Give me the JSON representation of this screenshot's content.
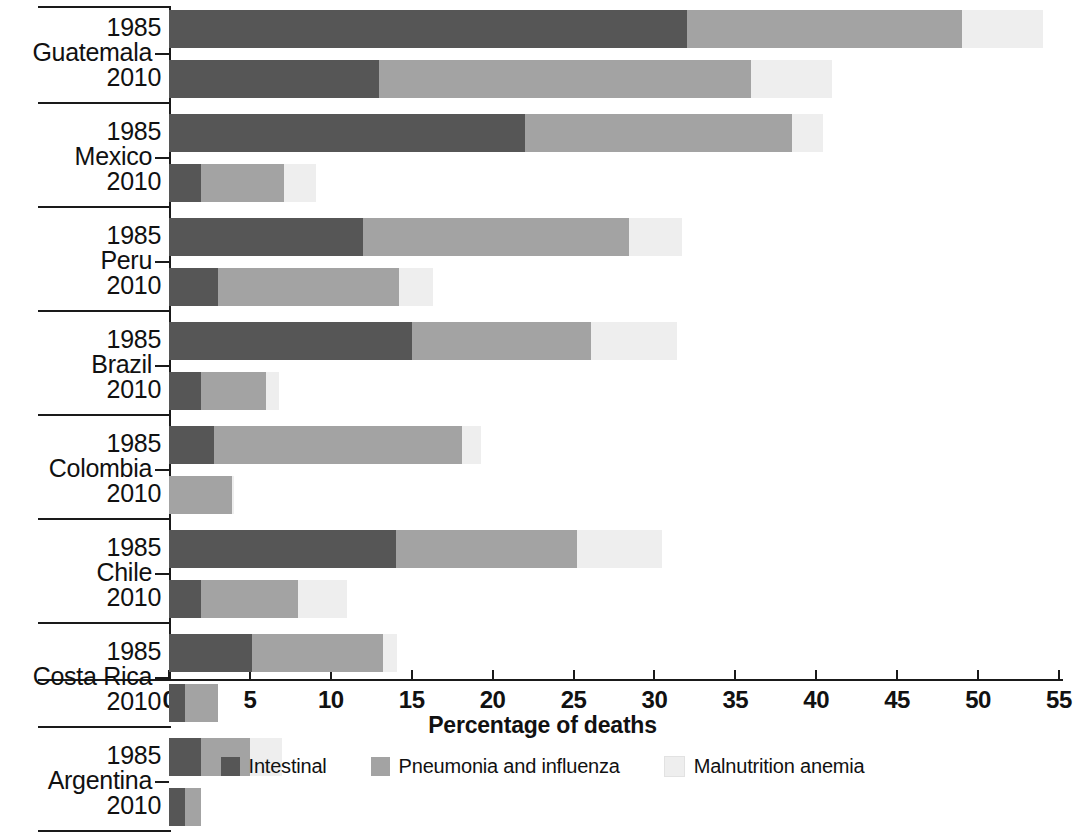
{
  "chart_data": {
    "type": "bar",
    "title": "",
    "subtype": "stacked-horizontal-bar-grouped",
    "xlabel": "Percentage of deaths",
    "ylabel": "",
    "xlim": [
      0,
      55
    ],
    "xticks": [
      0,
      5,
      10,
      15,
      20,
      25,
      30,
      35,
      40,
      45,
      50,
      55
    ],
    "grid": false,
    "legend_position": "bottom",
    "series": [
      {
        "name": "Intestinal",
        "color": "#565656"
      },
      {
        "name": "Pneumonia and influenza",
        "color": "#a3a3a3"
      },
      {
        "name": "Malnutrition anemia",
        "color": "#eeeeee"
      }
    ],
    "groups": [
      {
        "country": "Guatemala",
        "rows": [
          {
            "year": "1985",
            "values": [
              32.0,
              17.0,
              5.0
            ],
            "total": 54.0
          },
          {
            "year": "2010",
            "values": [
              13.0,
              23.0,
              5.0
            ],
            "total": 41.0
          }
        ]
      },
      {
        "country": "Mexico",
        "rows": [
          {
            "year": "1985",
            "values": [
              22.0,
              16.5,
              1.9
            ],
            "total": 40.4
          },
          {
            "year": "2010",
            "values": [
              2.0,
              5.1,
              2.0
            ],
            "total": 9.1
          }
        ]
      },
      {
        "country": "Peru",
        "rows": [
          {
            "year": "1985",
            "values": [
              12.0,
              16.4,
              3.3
            ],
            "total": 31.7
          },
          {
            "year": "2010",
            "values": [
              3.0,
              11.2,
              2.1
            ],
            "total": 16.3
          }
        ]
      },
      {
        "country": "Brazil",
        "rows": [
          {
            "year": "1985",
            "values": [
              15.0,
              11.1,
              5.3
            ],
            "total": 31.4
          },
          {
            "year": "2010",
            "values": [
              2.0,
              4.0,
              0.8
            ],
            "total": 6.8
          }
        ]
      },
      {
        "country": "Colombia",
        "rows": [
          {
            "year": "1985",
            "values": [
              2.8,
              15.3,
              1.2
            ],
            "total": 19.3
          },
          {
            "year": "2010",
            "values": [
              0.0,
              3.9,
              0.1
            ],
            "total": 4.0
          }
        ]
      },
      {
        "country": "Chile",
        "rows": [
          {
            "year": "1985",
            "values": [
              14.0,
              11.2,
              5.3
            ],
            "total": 30.5
          },
          {
            "year": "2010",
            "values": [
              2.0,
              6.0,
              3.0
            ],
            "total": 11.0
          }
        ]
      },
      {
        "country": "Costa Rica",
        "rows": [
          {
            "year": "1985",
            "values": [
              5.1,
              8.1,
              0.9
            ],
            "total": 14.1
          },
          {
            "year": "2010",
            "values": [
              1.0,
              2.0,
              0.0
            ],
            "total": 3.0
          }
        ]
      },
      {
        "country": "Argentina",
        "rows": [
          {
            "year": "1985",
            "values": [
              2.0,
              3.0,
              2.0
            ],
            "total": 7.0
          },
          {
            "year": "2010",
            "values": [
              1.0,
              1.0,
              0.0
            ],
            "total": 2.0
          }
        ]
      }
    ]
  },
  "axis": {
    "x_title": "Percentage of deaths",
    "tick_labels": [
      "0",
      "5",
      "10",
      "15",
      "20",
      "25",
      "30",
      "35",
      "40",
      "45",
      "50",
      "55"
    ]
  },
  "legend": {
    "items": [
      {
        "label": "Intestinal",
        "color": "#565656"
      },
      {
        "label": "Pneumonia and influenza",
        "color": "#a3a3a3"
      },
      {
        "label": "Malnutrition anemia",
        "color": "#eeeeee"
      }
    ]
  }
}
